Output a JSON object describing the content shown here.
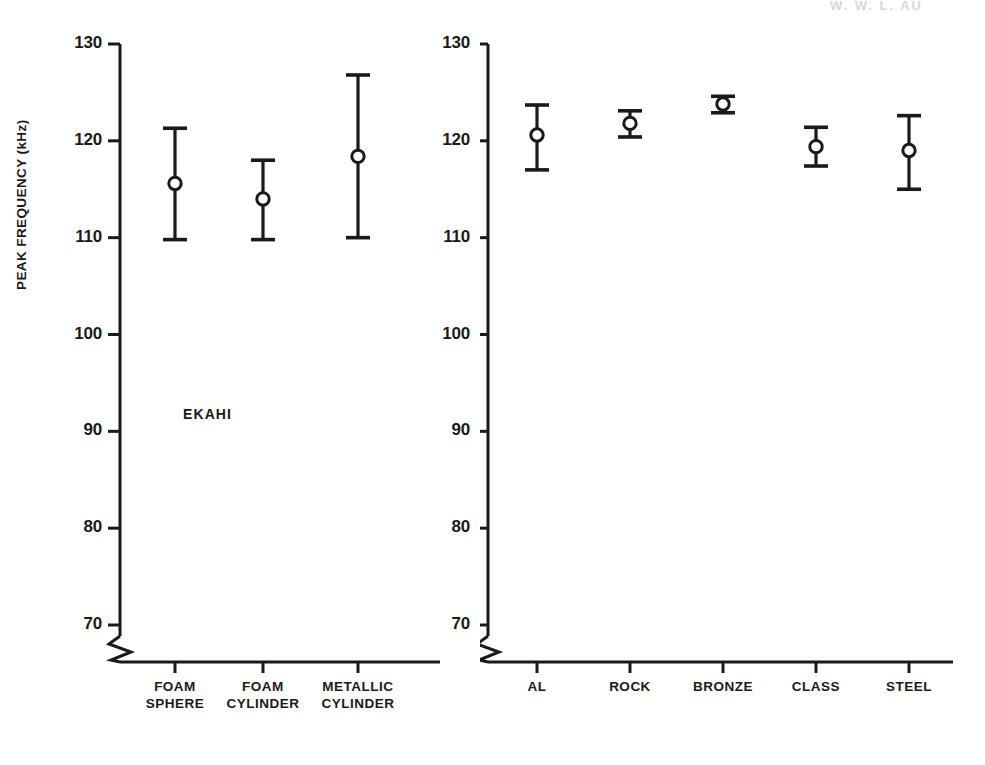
{
  "scan_header": "W. W. L. AU",
  "axis": {
    "ylabel": "PEAK FREQUENCY (kHz)",
    "yticks": [
      130,
      120,
      110,
      100,
      90,
      80,
      70
    ],
    "break_note": "axis break below 70"
  },
  "panels": [
    {
      "tag": "EKAHI"
    },
    {
      "tag": "SVEN"
    }
  ],
  "chart_data": [
    {
      "type": "scatter",
      "title": "EKAHI",
      "xlabel": "",
      "ylabel": "PEAK FREQUENCY (kHz)",
      "ylim": [
        70,
        130
      ],
      "yticks": [
        70,
        80,
        90,
        100,
        110,
        120,
        130
      ],
      "grid": false,
      "legend": null,
      "marker": "open-circle",
      "error_bars": "vertical-range",
      "categories": [
        "FOAM SPHERE",
        "FOAM CYLINDER",
        "METALLIC CYLINDER"
      ],
      "category_lines": [
        [
          "FOAM",
          "SPHERE"
        ],
        [
          "FOAM",
          "CYLINDER"
        ],
        [
          "METALLIC",
          "CYLINDER"
        ]
      ],
      "values": [
        115.6,
        114.0,
        118.4
      ],
      "err_low": [
        109.8,
        109.8,
        110.0
      ],
      "err_high": [
        121.3,
        118.0,
        126.8
      ]
    },
    {
      "type": "scatter",
      "title": "SVEN",
      "xlabel": "",
      "ylabel": "PEAK FREQUENCY (kHz)",
      "ylim": [
        70,
        130
      ],
      "yticks": [
        70,
        80,
        90,
        100,
        110,
        120,
        130
      ],
      "grid": false,
      "legend": null,
      "marker": "open-circle",
      "error_bars": "vertical-range",
      "categories": [
        "AL",
        "ROCK",
        "BRONZE",
        "CLASS",
        "STEEL"
      ],
      "category_lines": [
        [
          "AL"
        ],
        [
          "ROCK"
        ],
        [
          "BRONZE"
        ],
        [
          "CLASS"
        ],
        [
          "STEEL"
        ]
      ],
      "values": [
        120.6,
        121.8,
        123.8,
        119.4,
        119.0
      ],
      "err_low": [
        117.0,
        120.4,
        122.9,
        117.4,
        115.0
      ],
      "err_high": [
        123.7,
        123.1,
        124.6,
        121.4,
        122.6
      ]
    }
  ],
  "style": {
    "ink": "#1a1a1a",
    "background": "#ffffff"
  }
}
